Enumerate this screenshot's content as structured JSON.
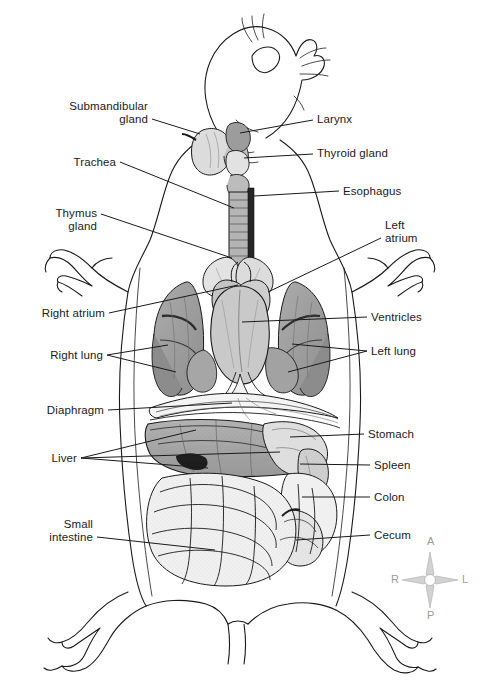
{
  "figure": {
    "background_color": "#ffffff",
    "text_color": "#1a1a1a",
    "leader_line_color": "#1a1a1a",
    "outline_color": "#1a1a1a",
    "width": 483,
    "height": 697
  },
  "labels_left": [
    {
      "id": "submandibular-gland",
      "text": "Submandibular\ngland",
      "line1": "Submandibular",
      "line2": "gland",
      "x": 148,
      "y": 100,
      "align": "right",
      "leader_from_x": 152,
      "leader_from_y": 119,
      "leader_to_x": 200,
      "leader_to_y": 134
    },
    {
      "id": "trachea",
      "text": "Trachea",
      "line1": "Trachea",
      "line2": "",
      "x": 116,
      "y": 156,
      "align": "right",
      "leader_from_x": 120,
      "leader_from_y": 162,
      "leader_to_x": 234,
      "leader_to_y": 208
    },
    {
      "id": "thymus-gland",
      "text": "Thymus\ngland",
      "line1": "Thymus",
      "line2": "gland",
      "x": 97,
      "y": 207,
      "align": "right",
      "leader_from_x": 101,
      "leader_from_y": 214,
      "leader_to_x": 232,
      "leader_to_y": 258
    },
    {
      "id": "right-atrium",
      "text": "Right atrium",
      "line1": "Right atrium",
      "line2": "",
      "x": 105,
      "y": 307,
      "align": "right",
      "leader_from_x": 109,
      "leader_from_y": 313,
      "leader_to_x": 238,
      "leader_to_y": 285
    },
    {
      "id": "right-lung",
      "text": "Right lung",
      "line1": "Right lung",
      "line2": "",
      "x": 103,
      "y": 349,
      "align": "right",
      "leader_from_x": 107,
      "leader_from_y": 355,
      "leader_to_x": 168,
      "leader_to_y": 345
    },
    {
      "id": "diaphragm",
      "text": "Diaphragm",
      "line1": "Diaphragm",
      "line2": "",
      "x": 104,
      "y": 404,
      "align": "right",
      "leader_from_x": 108,
      "leader_from_y": 410,
      "leader_to_x": 230,
      "leader_to_y": 400
    },
    {
      "id": "liver",
      "text": "Liver",
      "line1": "Liver",
      "line2": "",
      "x": 77,
      "y": 452,
      "align": "right",
      "leader_from_x": 81,
      "leader_from_y": 458,
      "leader_to_x": 215,
      "leader_to_y": 470
    },
    {
      "id": "small-intestine",
      "text": "Small\nintestine",
      "line1": "Small",
      "line2": "intestine",
      "x": 93,
      "y": 518,
      "align": "right",
      "leader_from_x": 97,
      "leader_from_y": 537,
      "leader_to_x": 213,
      "leader_to_y": 548
    }
  ],
  "labels_right": [
    {
      "id": "larynx",
      "text": "Larynx",
      "line1": "Larynx",
      "line2": "",
      "x": 317,
      "y": 113,
      "align": "left",
      "leader_from_x": 313,
      "leader_from_y": 120,
      "leader_to_x": 238,
      "leader_to_y": 133
    },
    {
      "id": "thyroid-gland",
      "text": "Thyroid gland",
      "line1": "Thyroid gland",
      "line2": "",
      "x": 317,
      "y": 147,
      "align": "left",
      "leader_from_x": 313,
      "leader_from_y": 154,
      "leader_to_x": 240,
      "leader_to_y": 157
    },
    {
      "id": "esophagus",
      "text": "Esophagus",
      "line1": "Esophagus",
      "line2": "",
      "x": 343,
      "y": 185,
      "align": "left",
      "leader_from_x": 339,
      "leader_from_y": 191,
      "leader_to_x": 252,
      "leader_to_y": 196
    },
    {
      "id": "left-atrium",
      "text": "Left\natrium",
      "line1": "Left",
      "line2": "atrium",
      "x": 385,
      "y": 219,
      "align": "left",
      "leader_from_x": 381,
      "leader_from_y": 238,
      "leader_to_x": 268,
      "leader_to_y": 290
    },
    {
      "id": "ventricles",
      "text": "Ventricles",
      "line1": "Ventricles",
      "line2": "",
      "x": 371,
      "y": 311,
      "align": "left",
      "leader_from_x": 367,
      "leader_from_y": 317,
      "leader_to_x": 240,
      "leader_to_y": 323
    },
    {
      "id": "left-lung",
      "text": "Left lung",
      "line1": "Left lung",
      "line2": "",
      "x": 371,
      "y": 345,
      "align": "left",
      "leader_from_x": 367,
      "leader_from_y": 351,
      "leader_to_x": 290,
      "leader_to_y": 350
    },
    {
      "id": "stomach",
      "text": "Stomach",
      "line1": "Stomach",
      "line2": "",
      "x": 368,
      "y": 428,
      "align": "left",
      "leader_from_x": 364,
      "leader_from_y": 434,
      "leader_to_x": 290,
      "leader_to_y": 437
    },
    {
      "id": "spleen",
      "text": "Spleen",
      "line1": "Spleen",
      "line2": "",
      "x": 374,
      "y": 459,
      "align": "left",
      "leader_from_x": 370,
      "leader_from_y": 465,
      "leader_to_x": 295,
      "leader_to_y": 463
    },
    {
      "id": "colon",
      "text": "Colon",
      "line1": "Colon",
      "line2": "",
      "x": 374,
      "y": 491,
      "align": "left",
      "leader_from_x": 370,
      "leader_from_y": 497,
      "leader_to_x": 305,
      "leader_to_y": 497
    },
    {
      "id": "cecum",
      "text": "Cecum",
      "line1": "Cecum",
      "line2": "",
      "x": 374,
      "y": 529,
      "align": "left",
      "leader_from_x": 370,
      "leader_from_y": 535,
      "leader_to_x": 297,
      "leader_to_y": 540
    }
  ],
  "compass": {
    "anterior": "A",
    "posterior": "P",
    "right": "R",
    "left": "L",
    "center_x": 430,
    "center_y": 580,
    "color": "#b0b0b0",
    "text_color": "#9a9a9a"
  },
  "organ_tones": {
    "lung": "#9d9d9d",
    "heart": "#c9c9c9",
    "liver": "#a6a6a6",
    "stomach": "#d8d8d8",
    "intestine": "#efefef",
    "gland": "#dcdcdc",
    "trachea": "#b5b5b5",
    "esophagus": "#2b2b2b",
    "body_fill": "#ffffff"
  }
}
